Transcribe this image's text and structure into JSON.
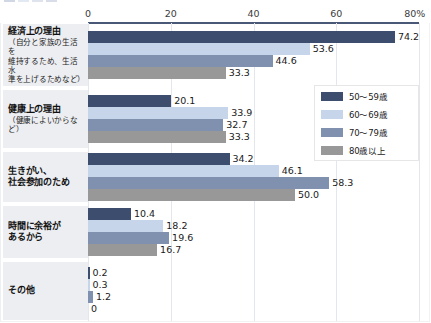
{
  "chart_data": {
    "type": "bar",
    "orientation": "horizontal",
    "title": "",
    "xlabel": "",
    "ylabel": "",
    "xlim": [
      0,
      80
    ],
    "xticks": [
      "0",
      "20",
      "40",
      "60",
      "80%"
    ],
    "xtick_values": [
      0,
      20,
      40,
      60,
      80
    ],
    "grid": true,
    "legend_position": "right",
    "categories": [
      "経済上の理由（自分と家族の生活を維持するため、生活水準を上げるためなど）",
      "健康上の理由（健康によいからなど）",
      "生きがい、社会参加のため",
      "時間に余裕があるから",
      "その他"
    ],
    "series": [
      {
        "name": "50～59歳",
        "color": "#3d4d6e",
        "values": [
          74.2,
          20.1,
          34.2,
          10.4,
          0.2
        ]
      },
      {
        "name": "60～69歳",
        "color": "#c6d5ea",
        "values": [
          53.6,
          33.9,
          46.1,
          18.2,
          0.3
        ]
      },
      {
        "name": "70～79歳",
        "color": "#8091b0",
        "values": [
          44.6,
          32.7,
          58.3,
          19.6,
          1.2
        ]
      },
      {
        "name": "80歳以上",
        "color": "#989898",
        "values": [
          33.3,
          33.3,
          50.0,
          16.7,
          0
        ]
      }
    ],
    "value_labels": [
      [
        "74.2",
        "53.6",
        "44.6",
        "33.3"
      ],
      [
        "20.1",
        "33.9",
        "32.7",
        "33.3"
      ],
      [
        "34.2",
        "46.1",
        "58.3",
        "50.0"
      ],
      [
        "10.4",
        "18.2",
        "19.6",
        "16.7"
      ],
      [
        "0.2",
        "0.3",
        "1.2",
        "0"
      ]
    ]
  },
  "axis": {
    "ticks": [
      "0",
      "20",
      "40",
      "60",
      "80%"
    ]
  },
  "categories": [
    {
      "main": "経済上の理由",
      "sub": "（自分と家族の生活を\n維持するため、生活水\n準を上げるためなど）",
      "sub_lines": [
        "（自分と家族の生活を",
        "維持するため、生活水",
        "準を上げるためなど）"
      ]
    },
    {
      "main": "健康上の理由",
      "sub": "（健康によいからなど）",
      "sub_lines": [
        "（健康によいからなど）"
      ]
    },
    {
      "main": "生きがい、\n社会参加のため",
      "sub": "",
      "main_lines": [
        "生きがい、",
        "社会参加のため"
      ]
    },
    {
      "main": "時間に余裕が\nあるから",
      "sub": "",
      "main_lines": [
        "時間に余裕が",
        "あるから"
      ]
    },
    {
      "main": "その他",
      "sub": "",
      "main_lines": [
        "その他"
      ]
    }
  ],
  "legend": {
    "items": [
      {
        "label": "50～59歳",
        "color": "#3d4d6e"
      },
      {
        "label": "60～69歳",
        "color": "#c6d5ea"
      },
      {
        "label": "70～79歳",
        "color": "#8091b0"
      },
      {
        "label": "80歳以上",
        "color": "#989898"
      }
    ]
  }
}
